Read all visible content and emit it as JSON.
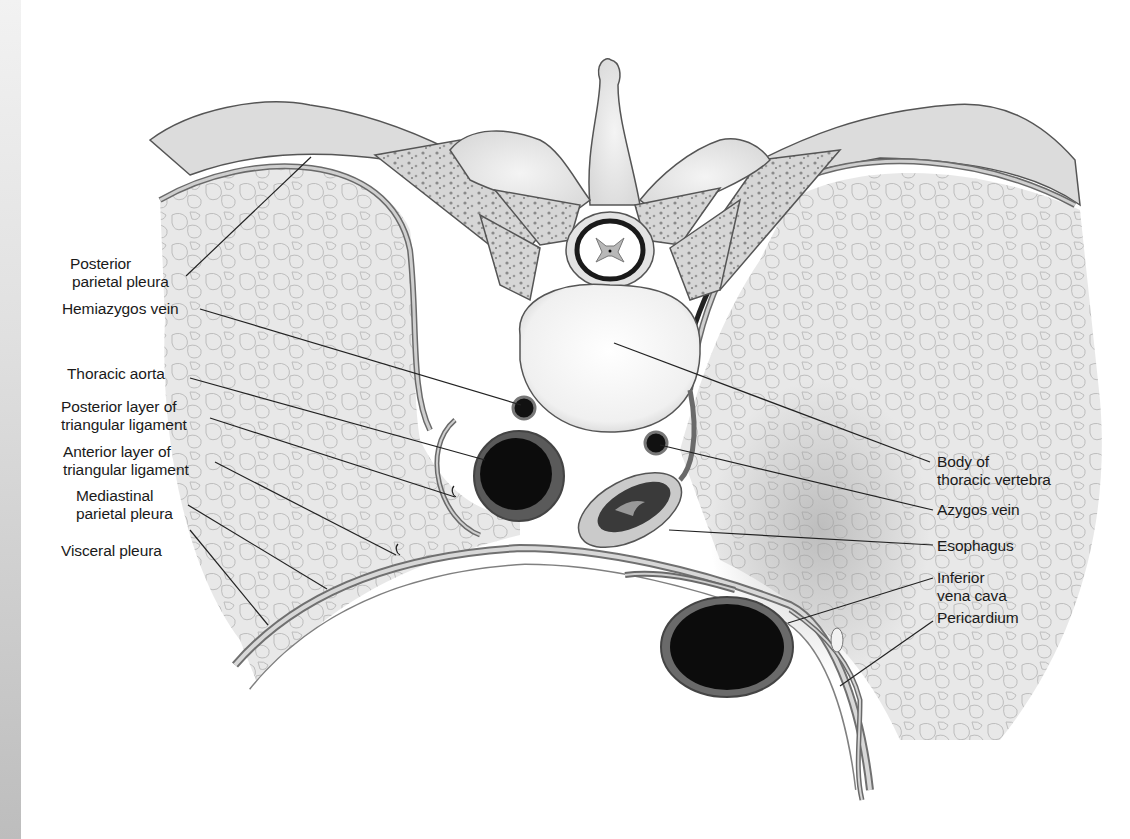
{
  "diagram": {
    "colors": {
      "background": "#ffffff",
      "lung_tissue": "#e9e9e9",
      "bone": "#e6e6e6",
      "vessel_lumen": "#111111",
      "outline": "#555555",
      "leader_line": "#222222",
      "text": "#1a1a1a"
    },
    "labels_left": [
      {
        "id": "posterior-parietal-pleura",
        "lines": [
          "Posterior",
          "parietal pleura"
        ]
      },
      {
        "id": "hemiazygos-vein",
        "lines": [
          "Hemiazygos vein"
        ]
      },
      {
        "id": "thoracic-aorta",
        "lines": [
          "Thoracic aorta"
        ]
      },
      {
        "id": "posterior-layer-triangular-ligament",
        "lines": [
          "Posterior layer of",
          "triangular ligament"
        ]
      },
      {
        "id": "anterior-layer-triangular-ligament",
        "lines": [
          "Anterior layer of",
          "triangular ligament"
        ]
      },
      {
        "id": "mediastinal-parietal-pleura",
        "lines": [
          "Mediastinal",
          "parietal pleura"
        ]
      },
      {
        "id": "visceral-pleura",
        "lines": [
          "Visceral pleura"
        ]
      }
    ],
    "labels_right": [
      {
        "id": "body-of-thoracic-vertebra",
        "lines": [
          "Body of",
          "thoracic vertebra"
        ]
      },
      {
        "id": "azygos-vein",
        "lines": [
          "Azygos vein"
        ]
      },
      {
        "id": "esophagus",
        "lines": [
          "Esophagus"
        ]
      },
      {
        "id": "inferior-vena-cava",
        "lines": [
          "Inferior",
          "vena cava"
        ]
      },
      {
        "id": "pericardium",
        "lines": [
          "Pericardium"
        ]
      }
    ]
  }
}
